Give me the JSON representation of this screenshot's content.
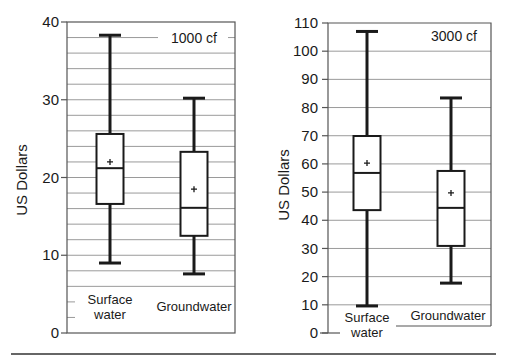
{
  "chart_data": [
    {
      "type": "box",
      "title": "1000 cf",
      "xlabel": "",
      "ylabel": "US Dollars",
      "ylim": [
        0,
        40
      ],
      "yticks": [
        0,
        10,
        20,
        30,
        40
      ],
      "grid": {
        "on": true,
        "step": 2
      },
      "categories": [
        "Surface water",
        "Groundwater"
      ],
      "series": [
        {
          "name": "Surface water",
          "whisker_low": 9.0,
          "q1": 16.6,
          "median": 21.2,
          "mean": 22.0,
          "q3": 25.6,
          "whisker_high": 38.3
        },
        {
          "name": "Groundwater",
          "whisker_low": 7.6,
          "q1": 12.5,
          "median": 16.1,
          "mean": 18.5,
          "q3": 23.3,
          "whisker_high": 30.2
        }
      ]
    },
    {
      "type": "box",
      "title": "3000 cf",
      "xlabel": "",
      "ylabel": "US Dollars",
      "ylim": [
        0,
        110
      ],
      "yticks": [
        0,
        10,
        20,
        30,
        40,
        50,
        60,
        70,
        80,
        90,
        100,
        110
      ],
      "grid": {
        "on": true,
        "step": 10
      },
      "categories": [
        "Surface water",
        "Groundwater"
      ],
      "series": [
        {
          "name": "Surface water",
          "whisker_low": 9.6,
          "q1": 43.6,
          "median": 56.8,
          "mean": 60.3,
          "q3": 69.9,
          "whisker_high": 107.0
        },
        {
          "name": "Groundwater",
          "whisker_low": 17.7,
          "q1": 30.9,
          "median": 44.4,
          "mean": 49.7,
          "q3": 57.5,
          "whisker_high": 83.4
        }
      ]
    }
  ],
  "panels": {
    "left": {
      "label": "1000 cf",
      "ylabel": "US Dollars",
      "ticks": [
        "0",
        "10",
        "20",
        "30",
        "40"
      ],
      "cat1_line1": "Surface",
      "cat1_line2": "water",
      "cat2": "Groundwater"
    },
    "right": {
      "label": "3000 cf",
      "ylabel": "US Dollars",
      "ticks": [
        "0",
        "10",
        "20",
        "30",
        "40",
        "50",
        "60",
        "70",
        "80",
        "90",
        "100",
        "110"
      ],
      "cat1_line1": "Surface",
      "cat1_line2": "water",
      "cat2": "Groundwater"
    }
  },
  "colors": {
    "ink": "#1a1a1a",
    "grid": "#9a9a9a",
    "background": "#ffffff"
  }
}
